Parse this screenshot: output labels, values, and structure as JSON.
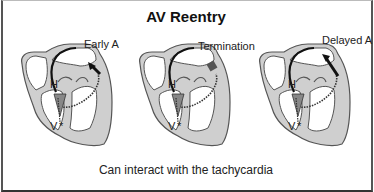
{
  "figure": {
    "title": "AV Reentry",
    "caption": "Can interact with the tachycardia",
    "panels": [
      {
        "label": "Early A",
        "his_label": "H",
        "ventricle_label": "V"
      },
      {
        "label": "Termination",
        "his_label": "H",
        "ventricle_label": "V"
      },
      {
        "label": "Delayed A",
        "his_label": "H",
        "ventricle_label": "V"
      }
    ],
    "colors": {
      "heart_fill": "#cfcfcf",
      "outline": "#555555",
      "pathway": "#111111",
      "border": "#444444"
    }
  }
}
